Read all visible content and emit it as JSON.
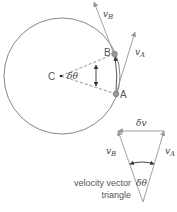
{
  "diagram": {
    "labels": {
      "center": "C",
      "point_a": "A",
      "point_b": "B",
      "angle": "δθ",
      "v_a_base": "v",
      "v_a_sub": "A",
      "v_b_base": "v",
      "v_b_sub": "B",
      "delta_v": "δv",
      "triangle_angle": "δθ",
      "caption_line1": "velocity vector",
      "caption_line2": "triangle"
    },
    "colors": {
      "line": "#777777",
      "arrow": "#999999",
      "point_fill": "#999999",
      "text": "#555555"
    }
  }
}
